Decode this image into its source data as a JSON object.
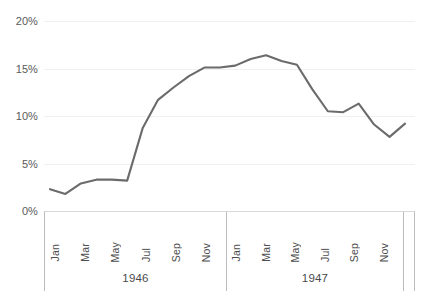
{
  "chart_data": {
    "type": "line",
    "title": "",
    "subtitle": "",
    "xlabel": "",
    "ylabel": "",
    "ylim": [
      0,
      20
    ],
    "ytick_labels": [
      "0%",
      "5%",
      "10%",
      "15%",
      "20%"
    ],
    "ytick_values": [
      0,
      5,
      10,
      15,
      20
    ],
    "grid": true,
    "legend": "none",
    "line_color": "#6b6b6b",
    "background_color": "#ffffff",
    "gridline_color": "#f0f0f0",
    "x_group_labels": [
      "1946",
      "1947"
    ],
    "x_month_ticks": [
      "Jan",
      "Mar",
      "May",
      "Jul",
      "Sep",
      "Nov"
    ],
    "categories": [
      "1946 Jan",
      "1946 Feb",
      "1946 Mar",
      "1946 Apr",
      "1946 May",
      "1946 Jun",
      "1946 Jul",
      "1946 Aug",
      "1946 Sep",
      "1946 Oct",
      "1946 Nov",
      "1946 Dec",
      "1947 Jan",
      "1947 Feb",
      "1947 Mar",
      "1947 Apr",
      "1947 May",
      "1947 Jun",
      "1947 Jul",
      "1947 Aug",
      "1947 Sep",
      "1947 Oct",
      "1947 Nov",
      "1947 Dec"
    ],
    "values": [
      2.3,
      1.8,
      2.9,
      3.3,
      3.3,
      3.2,
      8.7,
      11.7,
      13.0,
      14.2,
      15.1,
      15.1,
      15.3,
      16.0,
      16.4,
      15.8,
      15.4,
      12.8,
      10.5,
      10.4,
      11.3,
      9.1,
      7.8,
      9.2
    ]
  },
  "axis_table": {
    "groups": [
      {
        "year": "1946",
        "months": [
          "Jan",
          "Mar",
          "May",
          "Jul",
          "Sep",
          "Nov"
        ]
      },
      {
        "year": "1947",
        "months": [
          "Jan",
          "Mar",
          "May",
          "Jul",
          "Sep",
          "Nov"
        ]
      }
    ]
  }
}
